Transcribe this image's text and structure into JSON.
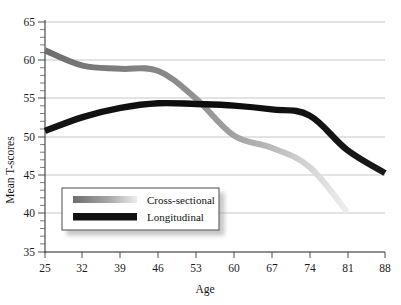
{
  "chart_data": {
    "type": "line",
    "title": "",
    "xlabel": "Age",
    "ylabel": "Mean T-scores",
    "x": [
      25,
      32,
      39,
      46,
      53,
      60,
      67,
      74,
      81,
      88
    ],
    "xlim": [
      25,
      88
    ],
    "ylim": [
      35,
      65
    ],
    "y_ticks": [
      35,
      40,
      45,
      50,
      55,
      60,
      65
    ],
    "y_minor_tick_step": 1,
    "x_ticks": [
      25,
      32,
      39,
      46,
      53,
      60,
      67,
      74,
      81,
      88
    ],
    "grid": "horizontal",
    "legend_position": "inside-lower-left",
    "series": [
      {
        "name": "Cross-sectional",
        "color": "#8c8c8c",
        "style": "fading-gray",
        "x": [
          25,
          32,
          39,
          46,
          53,
          60,
          67,
          74,
          81
        ],
        "values": [
          61.3,
          59.3,
          58.9,
          58.6,
          55.0,
          50.2,
          48.6,
          46.1,
          40.2
        ]
      },
      {
        "name": "Longitudinal",
        "color": "#101010",
        "style": "solid-black",
        "x": [
          25,
          32,
          39,
          46,
          53,
          60,
          67,
          74,
          81,
          88
        ],
        "values": [
          50.8,
          52.6,
          53.8,
          54.4,
          54.3,
          54.1,
          53.6,
          52.8,
          48.3,
          45.3
        ]
      }
    ]
  },
  "axes": {
    "x_tick_labels": [
      "25",
      "32",
      "39",
      "46",
      "53",
      "60",
      "67",
      "74",
      "81",
      "88"
    ],
    "y_tick_labels": [
      "65",
      "60",
      "55",
      "50",
      "45",
      "40",
      "35"
    ],
    "x_title": "Age",
    "y_title": "Mean T-scores"
  },
  "legend": {
    "items": [
      {
        "label": "Cross-sectional",
        "swatch": "gray-gradient-swatch"
      },
      {
        "label": "Longitudinal",
        "swatch": "black-swatch"
      }
    ]
  }
}
